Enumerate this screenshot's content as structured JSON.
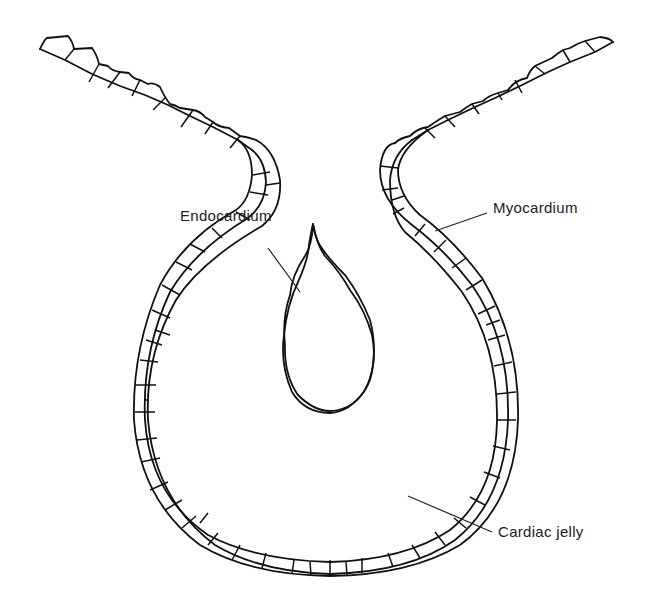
{
  "diagram": {
    "labels": [
      {
        "id": "endocardium",
        "text": "Endocardium",
        "x": 180,
        "y": 207,
        "line": [
          268,
          248,
          300,
          292
        ]
      },
      {
        "id": "myocardium",
        "text": "Myocardium",
        "x": 493,
        "y": 199,
        "line": [
          487,
          213,
          435,
          231
        ]
      },
      {
        "id": "cardiac-jelly",
        "text": "Cardiac jelly",
        "x": 498,
        "y": 523,
        "line": [
          492,
          532,
          408,
          496
        ]
      }
    ],
    "colors": {
      "line": "#111111",
      "text": "#222222",
      "background": "#ffffff"
    }
  }
}
